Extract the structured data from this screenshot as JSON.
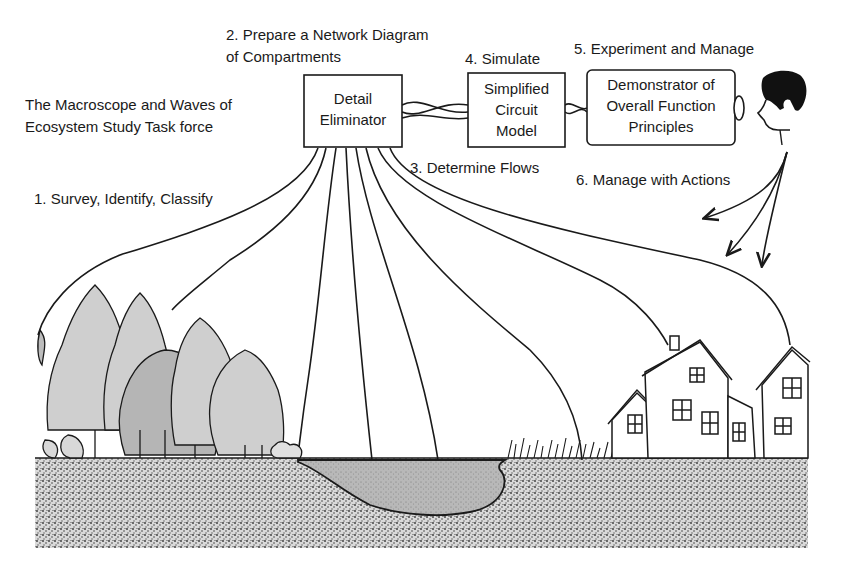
{
  "title": "The Macroscope and Waves of Ecosystem Study Task force",
  "title_lines": [
    "The Macroscope and Waves of",
    "Ecosystem Study Task force"
  ],
  "steps": [
    {
      "id": 1,
      "label": "1. Survey, Identify, Classify"
    },
    {
      "id": 2,
      "label_lines": [
        "2. Prepare a Network Diagram",
        "of Compartments"
      ]
    },
    {
      "id": 3,
      "label": "3. Determine Flows"
    },
    {
      "id": 4,
      "label": "4. Simulate"
    },
    {
      "id": 5,
      "label": "5. Experiment and Manage"
    },
    {
      "id": 6,
      "label": "6. Manage with Actions"
    }
  ],
  "boxes": {
    "detail_eliminator": {
      "lines": [
        "Detail",
        "Eliminator"
      ]
    },
    "circuit_model": {
      "lines": [
        "Simplified",
        "Circuit",
        "Model"
      ]
    },
    "demonstrator": {
      "lines": [
        "Demonstrator of",
        "Overall Function",
        "Principles"
      ]
    }
  },
  "scene": {
    "left": "forest",
    "center": "pond",
    "right": "houses",
    "observer": "person-head"
  },
  "colors": {
    "ink": "#1a1a1a",
    "ground": "#8a8a8a",
    "pond": "#b5b5b5",
    "background": "#ffffff"
  }
}
